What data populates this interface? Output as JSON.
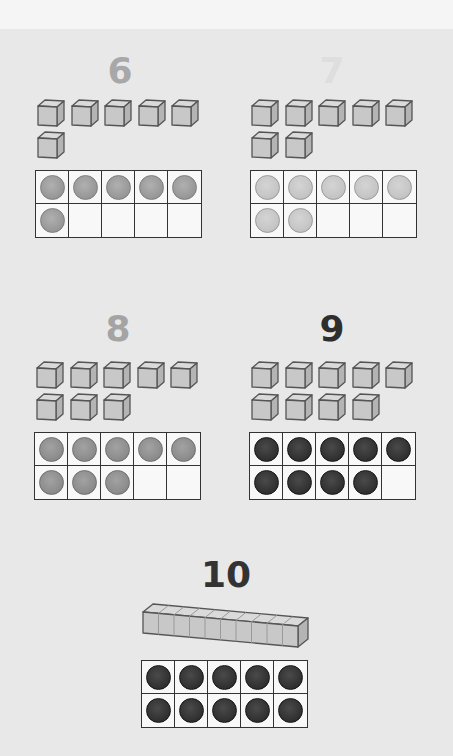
{
  "panels": [
    {
      "numeral": "6",
      "numeral_color": "#a8a8a8",
      "cubes": 6,
      "counters": 6,
      "counter_style": "mid",
      "numeral_x": 90,
      "numeral_y": 53,
      "cubes_x": 36,
      "cubes_y": 98,
      "frame_x": 35,
      "frame_y": 170
    },
    {
      "numeral": "7",
      "numeral_color": "#dedede",
      "cubes": 7,
      "counters": 7,
      "counter_style": "light",
      "numeral_x": 302,
      "numeral_y": 53,
      "cubes_x": 250,
      "cubes_y": 98,
      "frame_x": 250,
      "frame_y": 170
    },
    {
      "numeral": "8",
      "numeral_color": "#a4a4a4",
      "cubes": 8,
      "counters": 8,
      "counter_style": "midgray",
      "numeral_x": 88,
      "numeral_y": 311,
      "cubes_x": 35,
      "cubes_y": 360,
      "frame_x": 34,
      "frame_y": 432
    },
    {
      "numeral": "9",
      "numeral_color": "#2e2e2e",
      "cubes": 9,
      "counters": 9,
      "counter_style": "dark",
      "numeral_x": 302,
      "numeral_y": 311,
      "cubes_x": 250,
      "cubes_y": 360,
      "frame_x": 249,
      "frame_y": 432
    }
  ],
  "ten": {
    "numeral": "10",
    "numeral_color": "#333333",
    "rod_units": 10,
    "counters": 10,
    "counter_style": "dark",
    "numeral_x": 196,
    "numeral_y": 557,
    "frame_x": 141,
    "frame_y": 660
  },
  "colors": {
    "background": "#e8e8e8",
    "top_strip": "#f5f5f5",
    "cube_face": "#c8c8c8",
    "cube_top": "#dadada",
    "cube_side": "#b4b4b4",
    "cube_edge": "#555555",
    "grid_line": "#333333"
  }
}
